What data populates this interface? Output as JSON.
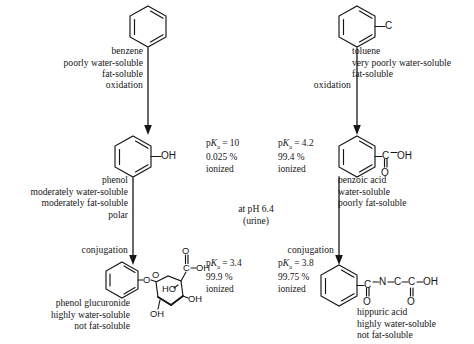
{
  "diagram": {
    "ph_note": {
      "line1": "at pH 6.4",
      "line2": "(urine)"
    },
    "colors": {
      "ink": "#161616",
      "background": "#ffffff"
    }
  },
  "left_pathway": {
    "step1": {
      "structure_name": "benzene-ring",
      "labels": [
        "benzene",
        "poorly water-soluble",
        "fat-soluble"
      ]
    },
    "arrow1_label": "oxidation",
    "step2": {
      "structure_name": "phenol-ring",
      "substituent": "OH",
      "labels": [
        "phenol",
        "moderately  water-soluble",
        "moderately fat-soluble",
        "polar"
      ]
    },
    "arrow2_label": "conjugation",
    "step3": {
      "structure_name": "phenol-glucuronide",
      "atoms": {
        "o_link": "O",
        "o_ring": "O",
        "carboxyl_c": "C",
        "carboxyl_o": "O",
        "carboxyl_oh": "OH",
        "ho": "HO",
        "oh_right": "OH",
        "oh_bottom": "OH"
      },
      "labels": [
        "phenol glucuronide",
        "highly water-soluble",
        "not fat-soluble"
      ]
    }
  },
  "right_pathway": {
    "step1": {
      "structure_name": "toluene-ring",
      "substituent": "C",
      "labels": [
        "toluene",
        "very poorly water-soluble",
        "fat-soluble"
      ]
    },
    "arrow1_label": "oxidation",
    "step2": {
      "structure_name": "benzoic-acid",
      "atoms": {
        "c": "C",
        "oh": "OH",
        "o": "O"
      },
      "labels": [
        "benzoic acid",
        "water-soluble",
        "poorly fat-soluble"
      ]
    },
    "arrow2_label": "conjugation",
    "step3": {
      "structure_name": "hippuric-acid",
      "atoms": {
        "c1": "C",
        "o1": "O",
        "n": "N",
        "c2": "C",
        "c3": "C",
        "o2": "O",
        "oh": "OH"
      },
      "labels": [
        "hippuric acid",
        "highly water-soluble",
        "not fat-soluble"
      ]
    }
  },
  "pka_values": {
    "phenol": {
      "pk": "p",
      "k": "K",
      "sub": "a",
      "eq": " = 10",
      "percent": "0.025 %",
      "state": "ionized"
    },
    "benzoic_acid": {
      "pk": "p",
      "k": "K",
      "sub": "a",
      "eq": " = 4.2",
      "percent": "99.4 %",
      "state": "ionized"
    },
    "phenol_glucuronide": {
      "pk": "p",
      "k": "K",
      "sub": "a",
      "eq": " = 3.4",
      "percent": "99.9 %",
      "state": "ionized"
    },
    "hippuric_acid": {
      "pk": "p",
      "k": "K",
      "sub": "a",
      "eq": " = 3.8",
      "percent": "99.75 %",
      "state": "ionized"
    }
  }
}
